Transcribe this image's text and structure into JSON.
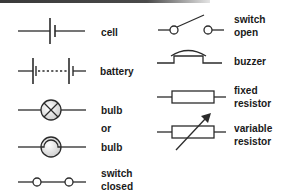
{
  "colors": {
    "stroke": "#2b2b2b",
    "text": "#1a1a1a",
    "bulb_fill": "#e6e6e6",
    "topbar": "#3a3a3a"
  },
  "left_column": {
    "cell": {
      "label": "cell",
      "icon": "cell-symbol"
    },
    "battery": {
      "label": "battery",
      "icon": "battery-symbol"
    },
    "bulb_cross": {
      "label": "bulb",
      "icon": "bulb-cross-symbol"
    },
    "or": {
      "label": "or"
    },
    "bulb_filament": {
      "label": "bulb",
      "icon": "bulb-filament-symbol"
    },
    "switch_closed": {
      "line1": "switch",
      "line2": "closed",
      "icon": "switch-closed-symbol"
    }
  },
  "right_column": {
    "switch_open": {
      "line1": "switch",
      "line2": "open",
      "icon": "switch-open-symbol"
    },
    "buzzer": {
      "label": "buzzer",
      "icon": "buzzer-symbol"
    },
    "fixed_resistor": {
      "line1": "fixed",
      "line2": "resistor",
      "icon": "fixed-resistor-symbol"
    },
    "variable_resistor": {
      "line1": "variable",
      "line2": "resistor",
      "icon": "variable-resistor-symbol"
    }
  }
}
